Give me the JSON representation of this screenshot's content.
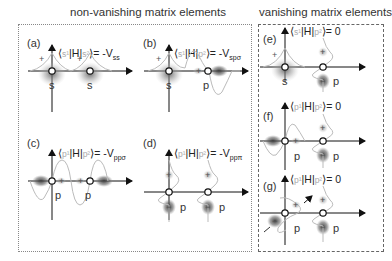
{
  "titles": {
    "non_vanishing": "non-vanishing matrix elements",
    "vanishing": "vanishing matrix elements"
  },
  "panels": [
    {
      "id": "a",
      "label": "(a)",
      "bra": "s¹",
      "ket": "s²",
      "op": "H",
      "rhs": "= -V",
      "sub": "ss",
      "orbitals": [
        "s",
        "s"
      ]
    },
    {
      "id": "b",
      "label": "(b)",
      "bra": "s¹",
      "ket": "p²",
      "op": "H",
      "rhs": "= -V",
      "sub": "spσ",
      "orbitals": [
        "s",
        "p"
      ]
    },
    {
      "id": "c",
      "label": "(c)",
      "bra": "p¹",
      "ket": "p²",
      "op": "H",
      "rhs": "= -V",
      "sub": "ppσ",
      "orbitals": [
        "p",
        "p"
      ]
    },
    {
      "id": "d",
      "label": "(d)",
      "bra": "p¹",
      "ket": "p²",
      "op": "H",
      "rhs": "= -V",
      "sub": "ppπ",
      "orbitals": [
        "p",
        "p"
      ]
    },
    {
      "id": "e",
      "label": "(e)",
      "bra": "s¹",
      "ket": "p²",
      "op": "H",
      "rhs": "= 0",
      "sub": "",
      "orbitals": [
        "s",
        "p"
      ]
    },
    {
      "id": "f",
      "label": "(f)",
      "bra": "p¹",
      "ket": "p²",
      "op": "H",
      "rhs": "= 0",
      "sub": "",
      "orbitals": [
        "p",
        "p"
      ]
    },
    {
      "id": "g",
      "label": "(g)",
      "bra": "p¹",
      "ket": "p²",
      "op": "H",
      "rhs": "= 0",
      "sub": "",
      "orbitals": [
        "p",
        "p"
      ]
    }
  ],
  "signs": {
    "plus": "+",
    "minus": "−"
  }
}
